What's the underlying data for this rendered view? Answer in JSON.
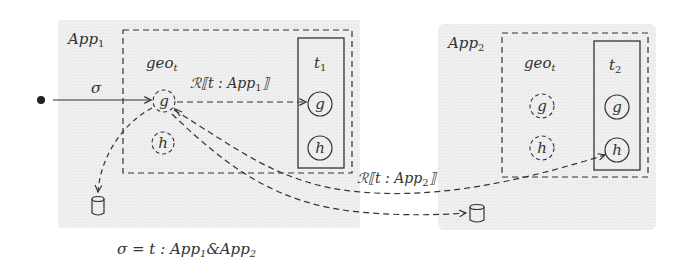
{
  "diagram": {
    "colors": {
      "app_bg": "#ececec",
      "stroke": "#333333",
      "background": "#ffffff"
    },
    "apps": [
      {
        "id": "app1",
        "label": "App",
        "label_sub": "1",
        "geo_label": "geo",
        "geo_sub": "t",
        "table_label": "t",
        "table_sub": "1",
        "geo_nodes": [
          "g",
          "h"
        ],
        "table_nodes": [
          "g",
          "h"
        ]
      },
      {
        "id": "app2",
        "label": "App",
        "label_sub": "2",
        "geo_label": "geo",
        "geo_sub": "t",
        "table_label": "t",
        "table_sub": "2",
        "geo_nodes": [
          "g",
          "h"
        ],
        "table_nodes": [
          "g",
          "h"
        ]
      }
    ],
    "edges": [
      {
        "from": "start",
        "to": "app1.geo.g",
        "label": "σ",
        "style": "solid"
      },
      {
        "from": "app1.geo.g",
        "to": "app1.t1.g",
        "label_prefix": "ℛ⟦t : App",
        "label_sub": "1",
        "label_suffix": "⟧",
        "style": "dashed"
      },
      {
        "from": "app1.geo.g",
        "to": "db1",
        "style": "dashed"
      },
      {
        "from": "app1.geo.g",
        "to": "app2.t2.h",
        "label_prefix": "ℛ⟦t : App",
        "label_sub": "2",
        "label_suffix": "⟧",
        "style": "dashed"
      },
      {
        "from": "app1.geo.g",
        "to": "db2",
        "style": "dashed"
      }
    ],
    "caption": {
      "prefix": "σ = t : App",
      "sub1": "1",
      "amp": "&App",
      "sub2": "2"
    }
  }
}
